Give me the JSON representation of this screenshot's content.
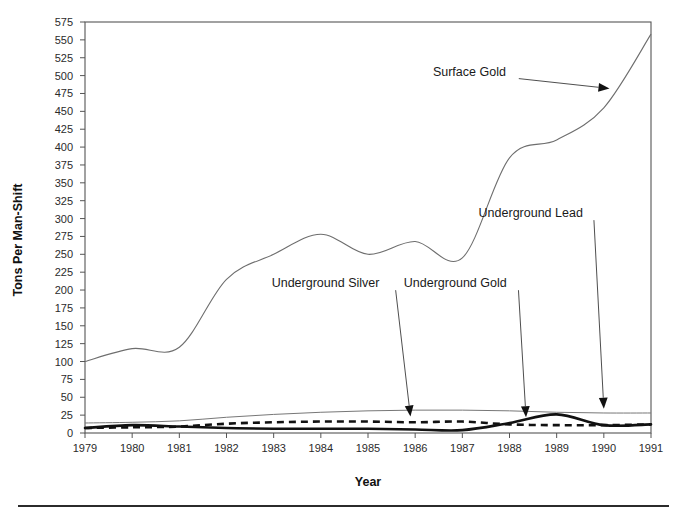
{
  "chart_data": {
    "type": "line",
    "title": "",
    "xlabel": "Year",
    "ylabel": "Tons Per Man-Shift",
    "xlim": [
      1979,
      1991
    ],
    "ylim": [
      0,
      575
    ],
    "grid": false,
    "legend_position": "annotations-inline",
    "x_tick_labels": [
      "1979",
      "1980",
      "1981",
      "1982",
      "1983",
      "1984",
      "1985",
      "1986",
      "1987",
      "1988",
      "1989",
      "1990",
      "1991"
    ],
    "y_tick_labels": [
      "0",
      "25",
      "50",
      "75",
      "100",
      "125",
      "150",
      "175",
      "200",
      "225",
      "250",
      "275",
      "300",
      "325",
      "350",
      "375",
      "400",
      "425",
      "450",
      "475",
      "500",
      "525",
      "550",
      "575"
    ],
    "x": [
      1979,
      1980,
      1981,
      1982,
      1983,
      1984,
      1985,
      1986,
      1987,
      1988,
      1989,
      1990,
      1991
    ],
    "series": [
      {
        "name": "Surface Gold",
        "style": "thin-solid",
        "color": "#6e6e6e",
        "values": [
          100,
          118,
          120,
          215,
          250,
          278,
          250,
          268,
          245,
          385,
          410,
          455,
          558
        ]
      },
      {
        "name": "Underground Lead",
        "style": "thin-solid",
        "color": "#777777",
        "values": [
          14,
          15,
          17,
          22,
          26,
          29,
          31,
          32,
          32,
          31,
          29,
          28,
          28
        ]
      },
      {
        "name": "Underground Silver",
        "style": "thick-dashed",
        "color": "#111111",
        "values": [
          7,
          8,
          9,
          13,
          15,
          16,
          16,
          15,
          16,
          12,
          11,
          11,
          12
        ]
      },
      {
        "name": "Underground Gold",
        "style": "thick-solid",
        "color": "#111111",
        "values": [
          7,
          11,
          9,
          7,
          6,
          6,
          6,
          5,
          4,
          14,
          26,
          11,
          12
        ]
      }
    ],
    "annotations": [
      {
        "text": "Surface Gold",
        "label_x": 1987.15,
        "label_y": 500,
        "target_x": 1990.12,
        "target_y": 482
      },
      {
        "text": "Underground Lead",
        "label_x": 1988.45,
        "label_y": 302,
        "target_x": 1990.0,
        "target_y": 34
      },
      {
        "text": "Underground Silver",
        "label_x": 1984.1,
        "label_y": 204,
        "target_x": 1985.9,
        "target_y": 23
      },
      {
        "text": "Underground Gold",
        "label_x": 1986.85,
        "label_y": 204,
        "target_x": 1988.35,
        "target_y": 22
      }
    ]
  }
}
